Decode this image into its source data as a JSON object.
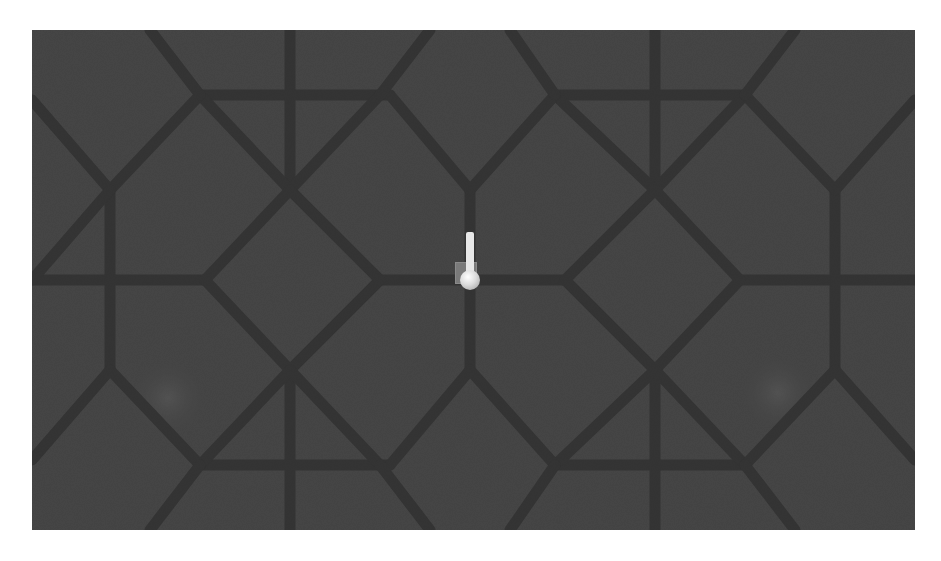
{
  "scene": {
    "type": "top-down 3D game view",
    "ground_texture": "grey octagon-and-diamond paving tiles",
    "background_color": "#454545",
    "grout_color": "#2a2a2a",
    "spot_highlights": [
      {
        "x": 168,
        "y": 398
      },
      {
        "x": 778,
        "y": 393
      }
    ]
  },
  "player": {
    "icon": "player-marker-icon",
    "x": 470,
    "y": 278,
    "base_color": "#7a7a7a",
    "ball_color": "#e8e8e8"
  }
}
